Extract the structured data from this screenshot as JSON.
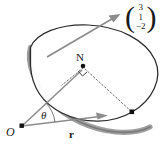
{
  "figure": {
    "labels": {
      "origin": "O",
      "foot_of_perpendicular": "N",
      "angle": "θ",
      "position_vector": "r"
    },
    "normal_vector": {
      "open_paren": "(",
      "close_paren": ")",
      "components": [
        "3",
        "1",
        "−2"
      ]
    },
    "colors": {
      "outline": "#2b2b2b",
      "rim": "#8a8a8a",
      "arrow": "#8c8c8c",
      "dotted": "#6e6e6e",
      "point": "#111111",
      "background": "#ffffff"
    },
    "elements": {
      "disc": "tilted-elliptical-plane",
      "normal_arrow": "arrow-from-plane-to-vector",
      "r_arrow": "arrow-from-origin-to-plane",
      "on_arrow": "arrow-from-origin-to-N",
      "right_angle": "right-angle-marker-at-N"
    }
  }
}
